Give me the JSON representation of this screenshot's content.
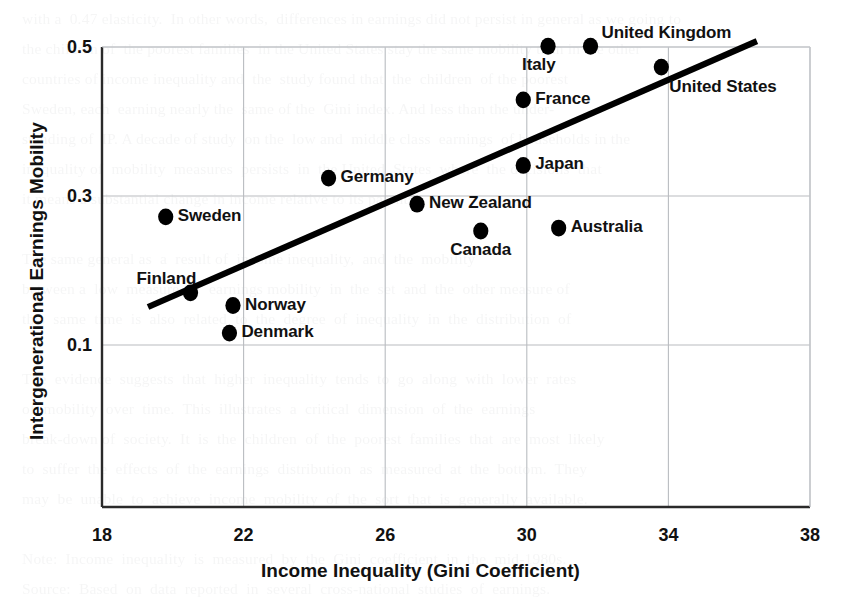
{
  "chart_data": {
    "type": "scatter",
    "title": "",
    "xlabel": "Income Inequality (Gini Coefficient)",
    "ylabel": "Intergenerational Earnings Mobility",
    "xlim": [
      18,
      38
    ],
    "ylim": [
      0.02,
      0.52
    ],
    "xticks": [
      "18",
      "22",
      "26",
      "30",
      "34",
      "38"
    ],
    "xtick_values": [
      18,
      22,
      26,
      30,
      34,
      38
    ],
    "yticks": [
      "0.5",
      "0.3",
      "0.1"
    ],
    "ytick_values": [
      0.5,
      0.3,
      0.1
    ],
    "grid": "both",
    "legend": "none",
    "point_color": "#000000",
    "line_color": "#000000",
    "points": [
      {
        "label": "Sweden",
        "x": 19.8,
        "y": 0.272,
        "label_pos": "right",
        "bold": false
      },
      {
        "label": "Finland",
        "x": 20.5,
        "y": 0.17,
        "label_pos": "above-left",
        "bold": false
      },
      {
        "label": "Norway",
        "x": 21.7,
        "y": 0.153,
        "label_pos": "right",
        "bold": false
      },
      {
        "label": "Denmark",
        "x": 21.6,
        "y": 0.116,
        "label_pos": "right",
        "bold": false
      },
      {
        "label": "Germany",
        "x": 24.4,
        "y": 0.324,
        "label_pos": "right",
        "bold": false
      },
      {
        "label": "New Zealand",
        "x": 26.9,
        "y": 0.289,
        "label_pos": "right",
        "bold": false
      },
      {
        "label": "Canada",
        "x": 28.7,
        "y": 0.253,
        "label_pos": "below",
        "bold": false
      },
      {
        "label": "France",
        "x": 29.9,
        "y": 0.429,
        "label_pos": "right",
        "bold": false
      },
      {
        "label": "Japan",
        "x": 29.9,
        "y": 0.341,
        "label_pos": "right",
        "bold": false
      },
      {
        "label": "Italy",
        "x": 30.6,
        "y": 0.501,
        "label_pos": "below-left",
        "bold": false
      },
      {
        "label": "Australia",
        "x": 30.9,
        "y": 0.257,
        "label_pos": "right",
        "bold": false
      },
      {
        "label": "United Kingdom",
        "x": 31.8,
        "y": 0.501,
        "label_pos": "above-right",
        "bold": false
      },
      {
        "label": "United States",
        "x": 33.8,
        "y": 0.473,
        "label_pos": "below-right",
        "bold": true
      }
    ],
    "trendline": {
      "x0": 19.3,
      "y0": 0.151,
      "x1": 36.5,
      "y1": 0.508
    }
  },
  "background_text": "with a  0.47 elasticity.  In other words,  differences in earnings did not persist in general as we going to\nthe children of  the poorest families  in the United States stay the same mobility than in the other\ncountries of income inequality and  the  study found that  the  children  of the poorest\nSweden, each  earning nearly the  same of the  Gini index. And less than the under-\nstanding of  IP. A decade of study  on the  low and  middle class  earnings  of households in the\ninequality of  mobility  measures  persists  in  the United  States  where  the decisions  that\nit means a substantial change in income relative to its parents.\n\nThe same general as  a  result of  income inequality,  and  the  mobility\nbetween a  low  measure  of  earnings mobility  in  the  set  and  the  other measure of\nthis  same  time  is  also  related  to  the  degree  of  inequality  in  the  distribution  of\n\nThe  evidence  suggests  that  higher  inequality  tends  to  go  along  with  lower  rates\nof  mobility  over  time.  This  illustrates  a  critical  dimension  of  the  earnings\nbreak-down of  society.  It  is  the  children  of  the  poorest  families  that  are  most  likely\nto  suffer  the  effects  of  the  earnings  distribution  as  measured  at  the  bottom.  They\nmay  be  unable  to  achieve  income  mobility  of  the  sort  that  is  generally  available.\n\nNote:  Income  inequality  is  measured  by  the  Gini  coefficient  in  the  mid-1980s.\nSource:  Based  on  data  reported  in  several  cross-national  studies  of  earnings."
}
